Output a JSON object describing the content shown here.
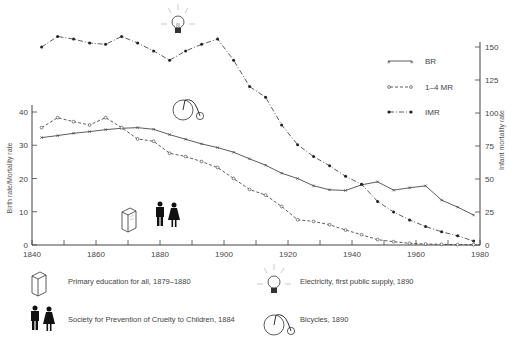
{
  "chart_data": {
    "type": "line",
    "title": "",
    "xlabel": "",
    "ylabel": "Birth rate/Mortality rate",
    "ylabel_right": "Infant mortality rate",
    "xlim": [
      1840,
      1980
    ],
    "ylim": [
      0,
      40
    ],
    "ylim_right": [
      0,
      150
    ],
    "x_ticks": [
      1840,
      1860,
      1880,
      1900,
      1920,
      1940,
      1960,
      1980
    ],
    "y_ticks": [
      0,
      10,
      20,
      30,
      40
    ],
    "y_ticks_right": [
      0,
      25,
      50,
      75,
      100,
      125,
      150
    ],
    "grid": false,
    "legend_position": "upper right",
    "series": [
      {
        "name": "BR",
        "axis": "left",
        "marker": "x",
        "linestyle": "solid",
        "x": [
          1843,
          1848,
          1853,
          1858,
          1863,
          1868,
          1873,
          1878,
          1883,
          1888,
          1893,
          1898,
          1903,
          1908,
          1913,
          1918,
          1923,
          1928,
          1933,
          1938,
          1943,
          1948,
          1953,
          1958,
          1963,
          1968,
          1973,
          1978
        ],
        "values": [
          32.3,
          32.9,
          33.6,
          34.1,
          34.7,
          35.1,
          35.3,
          34.8,
          33.2,
          31.8,
          30.4,
          29.3,
          27.9,
          25.9,
          24.0,
          21.6,
          20.0,
          17.8,
          16.6,
          16.4,
          18.1,
          19.0,
          16.5,
          17.2,
          17.8,
          13.5,
          11.4,
          9.0
        ]
      },
      {
        "name": "1-4 MR",
        "axis": "left",
        "marker": "o",
        "linestyle": "dashed",
        "x": [
          1843,
          1848,
          1853,
          1858,
          1863,
          1868,
          1873,
          1878,
          1883,
          1888,
          1893,
          1898,
          1903,
          1908,
          1913,
          1918,
          1923,
          1928,
          1933,
          1938,
          1943,
          1948,
          1953,
          1958,
          1963,
          1968,
          1973,
          1978
        ],
        "values": [
          35.3,
          38.3,
          37.1,
          36.1,
          38.3,
          35.3,
          31.9,
          31.2,
          27.6,
          26.6,
          25.1,
          23.3,
          20.0,
          16.7,
          15.0,
          11.6,
          7.6,
          7.1,
          6.1,
          4.5,
          3.1,
          1.6,
          1.0,
          0.5,
          0.3,
          0.2,
          0.1,
          0.1
        ]
      },
      {
        "name": "IMR",
        "axis": "right",
        "marker": "filled-circle",
        "linestyle": "dash-dot",
        "x": [
          1843,
          1848,
          1853,
          1858,
          1863,
          1868,
          1873,
          1878,
          1883,
          1888,
          1893,
          1898,
          1903,
          1908,
          1913,
          1918,
          1923,
          1928,
          1933,
          1938,
          1943,
          1948,
          1953,
          1958,
          1963,
          1968,
          1973,
          1978
        ],
        "values": [
          150,
          158,
          156,
          153,
          152,
          158,
          153,
          147,
          140,
          147,
          152,
          156,
          140,
          120,
          112,
          91,
          76,
          67,
          60,
          52,
          46,
          33,
          25,
          19,
          14,
          10,
          7,
          3
        ]
      }
    ],
    "annotations": [
      {
        "icon": "book",
        "x": 1874,
        "text": "Primary education for all, 1879–1880"
      },
      {
        "icon": "man-woman",
        "x": 1882,
        "text": "Society for Prevention of Cruelty to Children, 1884"
      },
      {
        "icon": "light-bulb",
        "x": 1890,
        "text": "Electricity, first public supply, 1890"
      },
      {
        "icon": "penny-farthing-bicycle",
        "x": 1890,
        "text": "Bicycles, 1890"
      }
    ]
  },
  "legend": {
    "br": "BR",
    "mr14": "1–4 MR",
    "imr": "IMR"
  },
  "notes": {
    "education": "Primary education for all, 1879–1880",
    "cruelty": "Society for Prevention of Cruelty to Children, 1884",
    "electricity": "Electricity, first public supply, 1890",
    "bicycles": "Bicycles, 1890"
  },
  "colors": {
    "line": "#333333",
    "axis": "#444444"
  }
}
